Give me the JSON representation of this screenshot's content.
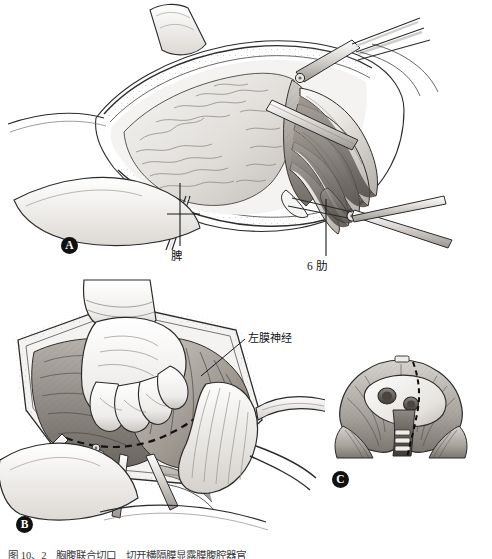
{
  "figure": {
    "style": "pen-and-ink medical illustration, grayscale",
    "caption": "图 10、2　胸腹联合切口　切开横隔膜显露膜腹腔器官"
  },
  "panels": [
    {
      "id": "A",
      "letter": "A",
      "name": "thoracotomy-exposure",
      "description": "Left thoracoabdominal incision with rib retractor, 6th rib resected, spleen visible"
    },
    {
      "id": "B",
      "letter": "B",
      "name": "diaphragm-dissection",
      "description": "Gloved hand retracting viscera, dashed diaphragm incision line, left phrenic nerve identified"
    },
    {
      "id": "C",
      "letter": "C",
      "name": "diaphragm-inset-cross-section",
      "description": "Inset cross-sectional view of diaphragm showing dashed incision path"
    }
  ],
  "callouts": [
    {
      "id": "spleen",
      "text": "脾",
      "panel": "A",
      "leader": "vertical line with cross bar to organ"
    },
    {
      "id": "rib6",
      "text": "6 肋",
      "panel": "A",
      "leader": "vertical line up to sixth rib"
    },
    {
      "id": "phrenic",
      "text": "左膜神经",
      "panel": "B",
      "leader": "diagonal line down-left to nerve"
    }
  ],
  "colors": {
    "ink": "#1a1a1a",
    "paper": "#ffffff",
    "tissue_light": "#e3e1de",
    "tissue_mid": "#b9b5b0",
    "tissue_dark": "#8d8883",
    "shadow": "#5e5a56",
    "bone": "#f2f0ed",
    "metal": "#cfcdc9"
  }
}
